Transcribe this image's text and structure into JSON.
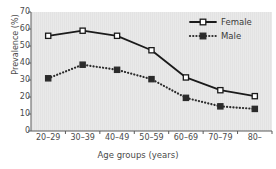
{
  "chart_data": {
    "type": "line",
    "title": "",
    "xlabel": "Age groups (years)",
    "ylabel": "Prevalence (%)",
    "categories": [
      "20–29",
      "30–39",
      "40–49",
      "50–59",
      "60–69",
      "70–79",
      "80–"
    ],
    "ylim": [
      0,
      70
    ],
    "yticks": [
      0,
      10,
      20,
      30,
      40,
      50,
      60,
      70
    ],
    "ytick_labels": [
      "0",
      "10",
      "20",
      "30",
      "40",
      "50",
      "60",
      "70"
    ],
    "grid": false,
    "legend_position": "top-right",
    "series": [
      {
        "name": "Female",
        "values": [
          56,
          59,
          56,
          47.5,
          31.5,
          24,
          20.5
        ],
        "line_style": "solid",
        "marker": "square-open",
        "color": "#1a1a1a"
      },
      {
        "name": "Male",
        "values": [
          31,
          39,
          36,
          30.5,
          19.5,
          14.5,
          13
        ],
        "line_style": "dotted",
        "marker": "square-filled",
        "color": "#2b2b2b"
      }
    ]
  },
  "legend": {
    "items": [
      {
        "label": "Female"
      },
      {
        "label": "Male"
      }
    ]
  },
  "colors": {
    "plot_background": "#e8e8e8",
    "axis": "#5a5a5a",
    "female_line": "#1a1a1a",
    "male_line": "#2b2b2b",
    "text": "#4a4a4a"
  }
}
